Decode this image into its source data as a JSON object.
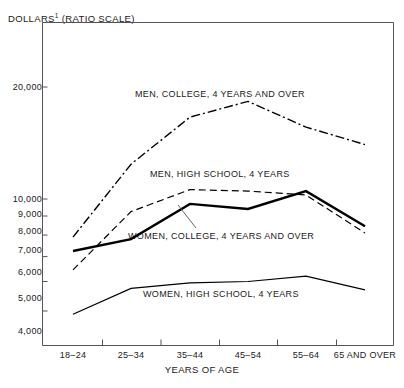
{
  "chart_data": {
    "type": "line",
    "title": "",
    "ylabel": "DOLLARS ¹ (RATIO SCALE)",
    "ylabel_text": "DOLLARS",
    "ylabel_footnote": "1",
    "ylabel_scale_note": "(RATIO SCALE)",
    "xlabel": "YEARS OF AGE",
    "scale": "log",
    "grid": false,
    "legend_position": "inline-annotations",
    "categories": [
      "18–24",
      "25–34",
      "35–44",
      "45–54",
      "55–64",
      "65 AND OVER"
    ],
    "ytick_labels": [
      "20,000",
      "10,000",
      "9,000",
      "8,000",
      "7,000",
      "6,000",
      "5,000",
      "4,000"
    ],
    "ytick_values": [
      20000,
      10000,
      9000,
      8000,
      7000,
      6000,
      5000,
      4000
    ],
    "ylim": [
      4000,
      24000
    ],
    "series": [
      {
        "name": "MEN, COLLEGE, 4 YEARS AND OVER",
        "style": "dash-dot",
        "values": [
          7900,
          12400,
          16600,
          18300,
          15600,
          14000
        ]
      },
      {
        "name": "MEN, HIGH SCHOOL, 4 YEARS",
        "style": "dashed",
        "values": [
          6450,
          9250,
          10600,
          10500,
          10250,
          8100
        ]
      },
      {
        "name": "WOMEN, COLLEGE, 4 YEARS AND OVER",
        "style": "solid-thick",
        "values": [
          7250,
          7800,
          9700,
          9400,
          10500,
          8450
        ]
      },
      {
        "name": "WOMEN, HIGH SCHOOL, 4 YEARS",
        "style": "solid-thin",
        "values": [
          4900,
          5750,
          5950,
          6000,
          6200,
          5700
        ]
      }
    ],
    "annotations": [
      {
        "text": "MEN, COLLEGE, 4 YEARS AND OVER",
        "x": 135,
        "y": 95
      },
      {
        "text": "MEN, HIGH SCHOOL, 4 YEARS",
        "x": 150,
        "y": 175
      },
      {
        "text": "WOMEN, COLLEGE, 4 YEARS AND OVER",
        "x": 128,
        "y": 237
      },
      {
        "text": "WOMEN, HIGH SCHOOL, 4 YEARS",
        "x": 143,
        "y": 295
      }
    ]
  },
  "axes": {
    "y_title": "DOLLARS",
    "y_footnote_marker": "1",
    "y_scale_note": "(RATIO SCALE)",
    "x_title": "YEARS OF AGE"
  },
  "ticks": {
    "y": [
      {
        "label": "20,000",
        "value": 20000
      },
      {
        "label": "10,000",
        "value": 10000
      },
      {
        "label": "9,000",
        "value": 9000
      },
      {
        "label": "8,000",
        "value": 8000
      },
      {
        "label": "7,000",
        "value": 7000
      },
      {
        "label": "6,000",
        "value": 6000
      },
      {
        "label": "5,000",
        "value": 5000
      },
      {
        "label": "4,000",
        "value": 4000
      }
    ],
    "x": [
      {
        "label": "18–24"
      },
      {
        "label": "25–34"
      },
      {
        "label": "35–44"
      },
      {
        "label": "45–54"
      },
      {
        "label": "55–64"
      },
      {
        "label": "65 AND OVER"
      }
    ]
  },
  "colors": {
    "line": "#000000",
    "axis": "#555555",
    "background": "#ffffff"
  }
}
